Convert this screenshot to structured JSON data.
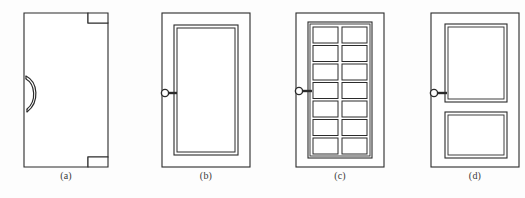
{
  "figure": {
    "type": "line-drawing",
    "background_color": "#fdfdfd",
    "stroke_color": "#2b2b2b",
    "panels": [
      {
        "id": "a",
        "caption": "(a)",
        "description": "flush door with crescent pull handle and corner notches",
        "door": {
          "x": 24,
          "y": 13,
          "width": 84,
          "height": 154
        },
        "handle": {
          "type": "crescent-pull-handle",
          "cx": 30,
          "cy": 94
        },
        "notches": [
          {
            "position": "top-right",
            "x": 88,
            "y": 13,
            "width": 20,
            "height": 10
          },
          {
            "position": "bottom-right",
            "x": 88,
            "y": 157,
            "width": 20,
            "height": 10
          }
        ],
        "caption_x": 66,
        "caption_y": 176
      },
      {
        "id": "b",
        "caption": "(b)",
        "description": "single large recessed panel door with lever knob",
        "door": {
          "x": 162,
          "y": 13,
          "width": 88,
          "height": 154
        },
        "inner_panels": [
          {
            "x": 174,
            "y": 25,
            "width": 64,
            "height": 130
          }
        ],
        "knob": {
          "type": "lever-knob",
          "cx": 165,
          "cy": 93
        },
        "caption_x": 206,
        "caption_y": 176
      },
      {
        "id": "c",
        "caption": "(c)",
        "description": "french glass door with grid of panes",
        "door": {
          "x": 296,
          "y": 13,
          "width": 88,
          "height": 154
        },
        "grid": {
          "x": 308,
          "y": 22,
          "width": 64,
          "height": 136,
          "rows": 7,
          "columns": 2
        },
        "knob": {
          "type": "lever-knob",
          "cx": 299,
          "cy": 91
        },
        "caption_x": 340,
        "caption_y": 176
      },
      {
        "id": "d",
        "caption": "(d)",
        "description": "two panel door, tall upper panel and short lower panel",
        "door": {
          "x": 431,
          "y": 13,
          "width": 88,
          "height": 154
        },
        "inner_panels": [
          {
            "x": 445,
            "y": 24,
            "width": 62,
            "height": 78
          },
          {
            "x": 445,
            "y": 112,
            "width": 62,
            "height": 46
          }
        ],
        "knob": {
          "type": "lever-knob",
          "cx": 434,
          "cy": 93
        },
        "caption_x": 475,
        "caption_y": 176
      }
    ]
  }
}
